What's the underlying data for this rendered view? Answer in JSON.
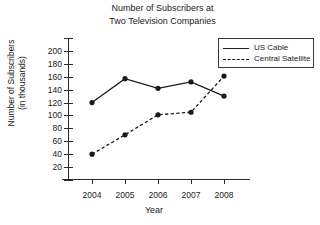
{
  "chart_data": {
    "type": "line",
    "title": "Number of Subscribers at Two Television Companies",
    "title_lines": [
      "Number of Subscribers at",
      "Two Television Companies"
    ],
    "xlabel": "Year",
    "ylabel": "Number of Subscribers (in thousands)",
    "ylabel_lines": [
      "Number of Subscribers",
      "(in thousands)"
    ],
    "categories": [
      "2004",
      "2005",
      "2006",
      "2007",
      "2008"
    ],
    "x": [
      2004,
      2005,
      2006,
      2007,
      2008
    ],
    "ylim": [
      0,
      220
    ],
    "yticks": [
      20,
      40,
      60,
      80,
      100,
      120,
      140,
      160,
      180,
      200
    ],
    "ytick_labels": [
      "20",
      "40",
      "60",
      "80",
      "100",
      "120",
      "140",
      "160",
      "180",
      "200"
    ],
    "grid": false,
    "legend_position": "top-right",
    "series": [
      {
        "name": "US Cable",
        "style": "solid",
        "marker": "filled-circle",
        "color": "#1a1a1a",
        "values": [
          120,
          157,
          142,
          152,
          130
        ]
      },
      {
        "name": "Central Satellite",
        "style": "dashed",
        "marker": "filled-circle",
        "color": "#1a1a1a",
        "values": [
          40,
          70,
          101,
          105,
          161
        ]
      }
    ]
  },
  "legend": {
    "entries": [
      {
        "label": "US Cable",
        "style": "solid"
      },
      {
        "label": "Central Satellite",
        "style": "dashed"
      }
    ]
  }
}
